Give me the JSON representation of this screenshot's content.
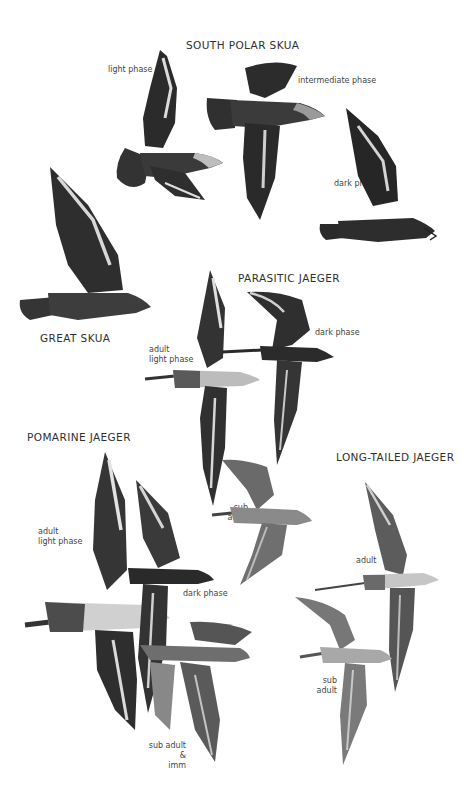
{
  "plate": {
    "background": "#ffffff",
    "ink_color": "#2a2a2a",
    "species": [
      {
        "name": "SOUTH POLAR SKUA",
        "figures": [
          {
            "caption": "light phase"
          },
          {
            "caption": "intermediate phase"
          },
          {
            "caption": "dark phase"
          }
        ]
      },
      {
        "name": "GREAT SKUA",
        "figures": []
      },
      {
        "name": "PARASITIC JAEGER",
        "figures": [
          {
            "caption": "adult\nlight phase"
          },
          {
            "caption": "dark phase"
          },
          {
            "caption": "sub\nadult"
          }
        ]
      },
      {
        "name": "POMARINE JAEGER",
        "figures": [
          {
            "caption": "adult\nlight phase"
          },
          {
            "caption": "dark phase"
          },
          {
            "caption": "sub adult &\nimm"
          }
        ]
      },
      {
        "name": "LONG-TAILED JAEGER",
        "figures": [
          {
            "caption": "adult"
          },
          {
            "caption": "sub\nadult"
          }
        ]
      }
    ]
  }
}
